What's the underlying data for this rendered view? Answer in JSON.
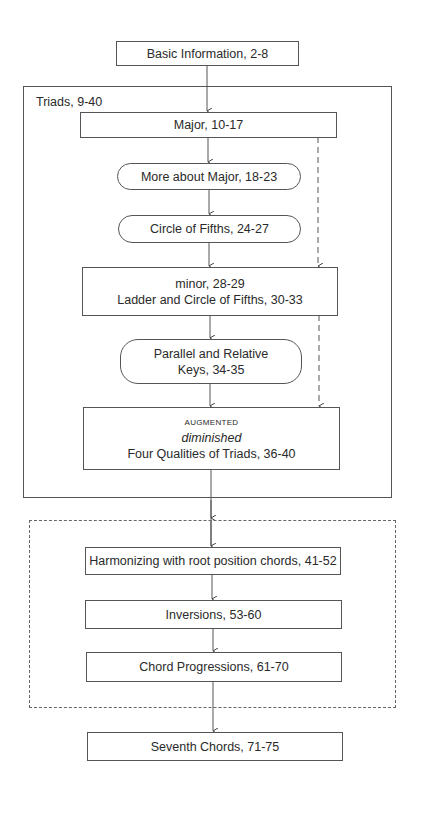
{
  "diagram": {
    "type": "flowchart",
    "nodes": {
      "basic": {
        "label": "Basic Information, 2-8"
      },
      "major": {
        "label": "Major, 10-17"
      },
      "more_major": {
        "label": "More about Major, 18-23"
      },
      "circle": {
        "label": "Circle of Fifths, 24-27"
      },
      "minor": {
        "line1": "minor, 28-29",
        "line2": "Ladder and Circle of Fifths, 30-33"
      },
      "parallel": {
        "line1": "Parallel and Relative",
        "line2": "Keys, 34-35"
      },
      "qualities": {
        "line1": "AUGMENTED",
        "line2": "diminished",
        "line3": "Four Qualities of Triads, 36-40"
      },
      "harmonizing": {
        "label": "Harmonizing with root position chords, 41-52"
      },
      "inversions": {
        "label": "Inversions, 53-60"
      },
      "progressions": {
        "label": "Chord Progressions, 61-70"
      },
      "seventh": {
        "label": "Seventh Chords, 71-75"
      }
    },
    "groups": {
      "triads": {
        "label": "Triads, 9-40",
        "border": "solid"
      },
      "harmony": {
        "label": "",
        "border": "dashed"
      }
    },
    "edges": [
      {
        "from": "basic",
        "to": "major",
        "style": "solid"
      },
      {
        "from": "major",
        "to": "more_major",
        "style": "solid"
      },
      {
        "from": "more_major",
        "to": "circle",
        "style": "solid"
      },
      {
        "from": "circle",
        "to": "minor",
        "style": "solid"
      },
      {
        "from": "major",
        "to": "minor",
        "style": "dashed"
      },
      {
        "from": "minor",
        "to": "parallel",
        "style": "solid"
      },
      {
        "from": "parallel",
        "to": "qualities",
        "style": "solid"
      },
      {
        "from": "minor",
        "to": "qualities",
        "style": "dashed"
      },
      {
        "from": "triads",
        "to": "harmony",
        "style": "solid"
      },
      {
        "from": "harmonizing",
        "to": "inversions",
        "style": "solid"
      },
      {
        "from": "inversions",
        "to": "progressions",
        "style": "solid"
      },
      {
        "from": "harmony",
        "to": "seventh",
        "style": "solid"
      }
    ],
    "colors": {
      "line": "#555555",
      "background": "#ffffff",
      "text": "#2a2a2a"
    }
  }
}
